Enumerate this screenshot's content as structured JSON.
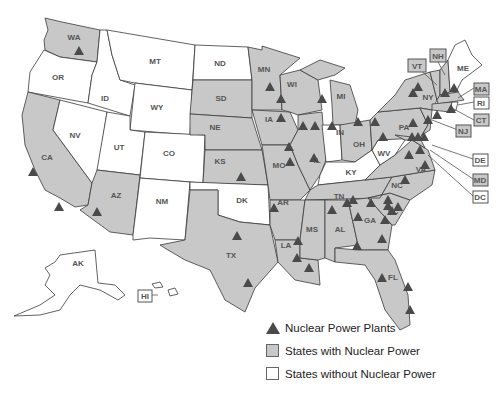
{
  "colors": {
    "with_nuclear": "#c8c8c8",
    "without_nuclear": "#ffffff",
    "plant_marker": "#4a4a4a",
    "border": "#3a3a3a"
  },
  "legend": {
    "items": [
      {
        "key": "plant",
        "label": "Nuclear Power Plants"
      },
      {
        "key": "with",
        "label": "States with Nuclear Power"
      },
      {
        "key": "without",
        "label": "States without Nuclear Power"
      }
    ]
  },
  "states": [
    {
      "abbr": "WA",
      "nuclear": true
    },
    {
      "abbr": "OR",
      "nuclear": false
    },
    {
      "abbr": "CA",
      "nuclear": true
    },
    {
      "abbr": "ID",
      "nuclear": false
    },
    {
      "abbr": "NV",
      "nuclear": false
    },
    {
      "abbr": "MT",
      "nuclear": false
    },
    {
      "abbr": "WY",
      "nuclear": false
    },
    {
      "abbr": "UT",
      "nuclear": false
    },
    {
      "abbr": "AZ",
      "nuclear": true
    },
    {
      "abbr": "CO",
      "nuclear": false
    },
    {
      "abbr": "NM",
      "nuclear": false
    },
    {
      "abbr": "ND",
      "nuclear": false
    },
    {
      "abbr": "SD",
      "nuclear": true
    },
    {
      "abbr": "NE",
      "nuclear": true
    },
    {
      "abbr": "KS",
      "nuclear": true
    },
    {
      "abbr": "DK",
      "nuclear": false
    },
    {
      "abbr": "TX",
      "nuclear": true
    },
    {
      "abbr": "MN",
      "nuclear": true
    },
    {
      "abbr": "IA",
      "nuclear": true
    },
    {
      "abbr": "MO",
      "nuclear": true
    },
    {
      "abbr": "AR",
      "nuclear": true
    },
    {
      "abbr": "LA",
      "nuclear": true
    },
    {
      "abbr": "WI",
      "nuclear": true
    },
    {
      "abbr": "IL",
      "nuclear": true
    },
    {
      "abbr": "MI",
      "nuclear": true
    },
    {
      "abbr": "IN",
      "nuclear": false
    },
    {
      "abbr": "OH",
      "nuclear": true
    },
    {
      "abbr": "KY",
      "nuclear": false
    },
    {
      "abbr": "TN",
      "nuclear": true
    },
    {
      "abbr": "MS",
      "nuclear": true
    },
    {
      "abbr": "AL",
      "nuclear": true
    },
    {
      "abbr": "GA",
      "nuclear": true
    },
    {
      "abbr": "FL",
      "nuclear": true
    },
    {
      "abbr": "SC",
      "nuclear": true
    },
    {
      "abbr": "NC",
      "nuclear": true
    },
    {
      "abbr": "VA",
      "nuclear": true
    },
    {
      "abbr": "WV",
      "nuclear": false
    },
    {
      "abbr": "PA",
      "nuclear": true
    },
    {
      "abbr": "NY",
      "nuclear": true
    },
    {
      "abbr": "ME",
      "nuclear": false
    },
    {
      "abbr": "AK",
      "nuclear": false
    },
    {
      "abbr": "HI",
      "nuclear": false
    }
  ],
  "callouts": [
    {
      "abbr": "VT",
      "nuclear": true
    },
    {
      "abbr": "NH",
      "nuclear": true
    },
    {
      "abbr": "MA",
      "nuclear": true
    },
    {
      "abbr": "RI",
      "nuclear": false
    },
    {
      "abbr": "CT",
      "nuclear": true
    },
    {
      "abbr": "NJ",
      "nuclear": true
    },
    {
      "abbr": "DE",
      "nuclear": false
    },
    {
      "abbr": "MD",
      "nuclear": true
    },
    {
      "abbr": "DC",
      "nuclear": false
    }
  ],
  "plant_count_visible": 66
}
